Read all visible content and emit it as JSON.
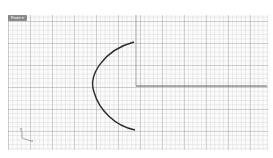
{
  "viewport": {
    "tab_label": "Front",
    "tab_chevron": "▼",
    "grid": {
      "minor_color": "#d6d6d6",
      "major_color": "#b4b4b4",
      "background": "#fbfbfb"
    },
    "axis_widget": {
      "y_label": "y",
      "x_label": "x"
    }
  },
  "geometry": {
    "curve_color": "#2a2a2a",
    "arc": {
      "start": [
        134,
        42
      ],
      "leftmost": [
        94,
        86
      ],
      "end": [
        135,
        130
      ]
    },
    "line": {
      "start": [
        136,
        86
      ],
      "end": [
        267,
        86
      ]
    },
    "y_axis": {
      "x": 136,
      "from": 15,
      "to": 86
    }
  }
}
